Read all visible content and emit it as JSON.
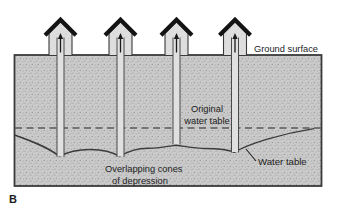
{
  "figure": {
    "panel_label": "B",
    "labels": {
      "ground_surface": "Ground surface",
      "original_water_table": [
        "Original",
        "water table"
      ],
      "water_table": "Water table",
      "overlapping_cones": [
        "Overlapping cones",
        "of depression"
      ]
    },
    "colors": {
      "background": "#ffffff",
      "ground_fill": "#cbcbcb",
      "ground_speckle": "#8f8f8f",
      "house_fill": "#dedede",
      "pipe_fill": "#e0e0e0",
      "roof": "#141414",
      "outline": "#3a3a3a",
      "dashed_water_table": "#5a5a5a",
      "curve": "#3c3c3c",
      "text": "#1c1c1c"
    },
    "wells": [
      {
        "name": "well-1",
        "center_x": 60.5,
        "bottom_y": 157
      },
      {
        "name": "well-2",
        "center_x": 120.5,
        "bottom_y": 157
      },
      {
        "name": "well-3",
        "center_x": 176.5,
        "bottom_y": 144.5
      },
      {
        "name": "well-4",
        "center_x": 235,
        "bottom_y": 152.5
      }
    ],
    "original_water_table_y": 128
  }
}
